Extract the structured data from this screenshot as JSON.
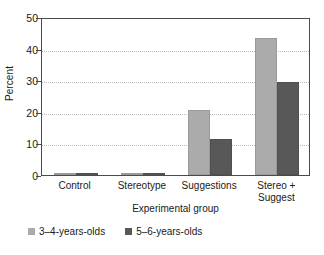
{
  "chart_data": {
    "type": "bar",
    "title": "",
    "subtitle": "",
    "xlabel": "Experimental group",
    "ylabel": "Percent",
    "categories": [
      "Control",
      "Stereotype",
      "Suggestions",
      "Stereo +\nSuggest"
    ],
    "series": [
      {
        "name": "3–4-years-olds",
        "color": "#ababab",
        "values": [
          0,
          0,
          20.5,
          43.5
        ]
      },
      {
        "name": "5–6-years-olds",
        "color": "#585858",
        "values": [
          0,
          0,
          11.5,
          29.5
        ]
      }
    ],
    "ylim": [
      0,
      50
    ],
    "yticks": [
      0,
      10,
      20,
      30,
      40,
      50
    ],
    "ytick_labels": [
      "0",
      "10",
      "20",
      "30",
      "40",
      "50"
    ],
    "grid": "horizontal-dotted",
    "legend_position": "below-plot-left",
    "bar_grouping": "clustered-adjacent"
  },
  "axes": {
    "y_title": "Percent",
    "x_title": "Experimental group"
  },
  "legend": {
    "entries": [
      {
        "label": "3–4-years-olds",
        "swatch": "light-gray-swatch-icon"
      },
      {
        "label": "5–6-years-olds",
        "swatch": "dark-gray-swatch-icon"
      }
    ]
  }
}
